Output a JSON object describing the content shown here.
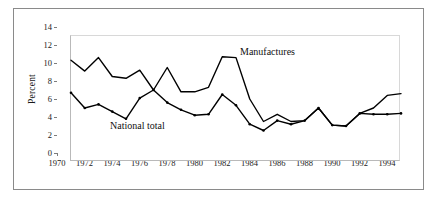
{
  "figure": {
    "y_axis_title": "Percent",
    "annotations": {
      "manufactures": "Manufactures",
      "national_total": "National total"
    }
  },
  "axes": {
    "y_ticks": [
      "0",
      "2",
      "4",
      "6",
      "8",
      "10",
      "12",
      "14"
    ],
    "x_ticks": [
      "1970",
      "1972",
      "1974",
      "1976",
      "1978",
      "1980",
      "1982",
      "1984",
      "1986",
      "1988",
      "1990",
      "1992",
      "1994"
    ]
  },
  "chart_data": {
    "type": "line",
    "title": "",
    "xlabel": "",
    "ylabel": "Percent",
    "xlim": [
      1970,
      1994
    ],
    "ylim": [
      0,
      14
    ],
    "ytick_values": [
      0,
      2,
      4,
      6,
      8,
      10,
      12,
      14
    ],
    "xtick_values": [
      1970,
      1972,
      1974,
      1976,
      1978,
      1980,
      1982,
      1984,
      1986,
      1988,
      1990,
      1992,
      1994
    ],
    "grid": false,
    "legend": "inline-annotations",
    "x": [
      1970,
      1971,
      1972,
      1973,
      1974,
      1975,
      1976,
      1977,
      1978,
      1979,
      1980,
      1981,
      1982,
      1983,
      1984,
      1985,
      1986,
      1987,
      1988,
      1989,
      1990,
      1991,
      1992,
      1993,
      1994
    ],
    "series": [
      {
        "name": "Manufactures",
        "color": "#000000",
        "markers": false,
        "values": [
          11.3,
          10.1,
          11.6,
          9.5,
          9.3,
          10.2,
          8.0,
          10.5,
          7.8,
          7.8,
          8.3,
          11.7,
          11.6,
          7.0,
          4.5,
          5.3,
          4.5,
          4.6,
          6.0,
          4.1,
          4.0,
          5.4,
          6.0,
          7.4,
          7.6
        ]
      },
      {
        "name": "National total",
        "color": "#000000",
        "markers": true,
        "values": [
          7.7,
          6.0,
          6.4,
          5.6,
          4.8,
          7.1,
          8.0,
          6.6,
          5.8,
          5.2,
          5.3,
          7.5,
          6.3,
          4.2,
          3.5,
          4.6,
          4.2,
          4.6,
          6.0,
          4.1,
          4.0,
          5.4,
          5.3,
          5.3,
          5.4
        ]
      }
    ]
  }
}
